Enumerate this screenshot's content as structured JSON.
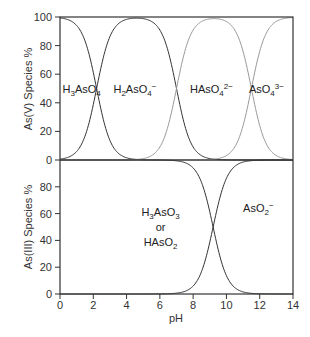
{
  "chart_data": [
    {
      "type": "line",
      "title": "",
      "panel": "upper",
      "xlabel": "",
      "ylabel": "As(V) Species %",
      "xlim": [
        0,
        14
      ],
      "ylim": [
        0,
        100
      ],
      "xticks": [
        0,
        2,
        4,
        6,
        8,
        10,
        12,
        14
      ],
      "yticks": [
        0,
        20,
        40,
        60,
        80,
        100
      ],
      "grid": false,
      "pKa": [
        2.2,
        7.0,
        11.5
      ],
      "series": [
        {
          "name": "H3AsO4",
          "label_html": "H<tspan baseline-shift='sub' font-size='8'>3</tspan>AsO<tspan baseline-shift='sub' font-size='8'>4</tspan>",
          "color": "#333333",
          "label_pos": [
            1.5,
            52
          ]
        },
        {
          "name": "H2AsO4-",
          "color": "#333333",
          "label_pos": [
            4.6,
            52
          ]
        },
        {
          "name": "HAsO4 2-",
          "color": "#999999",
          "label_pos": [
            9.2,
            52
          ]
        },
        {
          "name": "AsO4 3-",
          "color": "#999999",
          "label_pos": [
            12.6,
            52
          ]
        }
      ],
      "species_labels": [
        {
          "base": "H",
          "sub1": "3",
          "mid": "AsO",
          "sub2": "4",
          "sup": "",
          "x": 1.3,
          "y": 50
        },
        {
          "base": "H",
          "sub1": "2",
          "mid": "AsO",
          "sub2": "4",
          "sup": "−",
          "x": 4.5,
          "y": 50
        },
        {
          "base": "HAsO",
          "sub1": "",
          "mid": "",
          "sub2": "4",
          "sup": "2−",
          "x": 9.1,
          "y": 50
        },
        {
          "base": "AsO",
          "sub1": "",
          "mid": "",
          "sub2": "4",
          "sup": "3−",
          "x": 12.4,
          "y": 50
        }
      ]
    },
    {
      "type": "line",
      "title": "",
      "panel": "lower",
      "xlabel": "pH",
      "ylabel": "As(III) Species %",
      "xlim": [
        0,
        14
      ],
      "ylim": [
        0,
        100
      ],
      "xticks": [
        0,
        2,
        4,
        6,
        8,
        10,
        12,
        14
      ],
      "yticks": [
        0,
        20,
        40,
        60,
        80
      ],
      "grid": false,
      "pKa": [
        9.2
      ],
      "series": [
        {
          "name": "H3AsO3 or HAsO2",
          "color": "#333333"
        },
        {
          "name": "AsO2-",
          "color": "#333333"
        }
      ],
      "species_labels": [
        {
          "line1": "H3AsO3",
          "line2": "or",
          "line3": "HAsO2",
          "x": 5.8,
          "y": 55
        },
        {
          "line1": "AsO2-",
          "x": 11.8,
          "y": 72
        }
      ]
    }
  ],
  "labels": {
    "upper_ylabel": "As(V) Species %",
    "lower_ylabel": "As(III) Species %",
    "xlabel": "pH",
    "or": "or"
  }
}
